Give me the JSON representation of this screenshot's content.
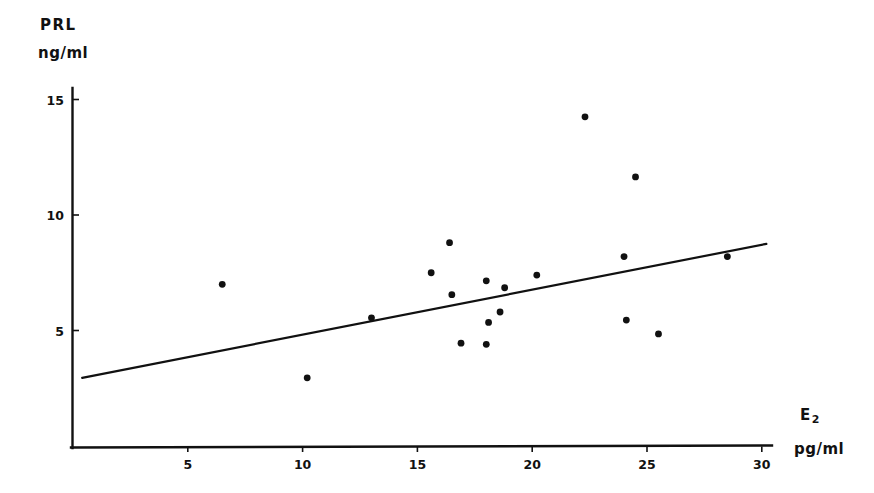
{
  "figure": {
    "background_color": "#ffffff",
    "ink_color": "#111111"
  },
  "axes": {
    "y": {
      "title": "PRL",
      "unit": "ng/ml",
      "ticks": [
        5,
        10,
        15
      ],
      "tick_labels": [
        "5",
        "10",
        "15"
      ],
      "range": [
        0,
        16.4
      ]
    },
    "x": {
      "title": "E",
      "title_sub": "2",
      "unit": "pg/ml",
      "ticks": [
        5,
        10,
        15,
        20,
        25,
        30
      ],
      "tick_labels": [
        "5",
        "10",
        "15",
        "20",
        "25",
        "30"
      ],
      "range": [
        0,
        31.3
      ]
    }
  },
  "chart_data": {
    "type": "scatter",
    "title": "",
    "xlabel": "E2 (pg/ml)",
    "ylabel": "PRL (ng/ml)",
    "xlim": [
      0,
      31.3
    ],
    "ylim": [
      0,
      16.4
    ],
    "grid": false,
    "legend": "none",
    "marker": {
      "shape": "circle",
      "color": "#111111",
      "radius_px": 3.4
    },
    "points": [
      {
        "x": 6.5,
        "y": 7.0
      },
      {
        "x": 10.2,
        "y": 2.95
      },
      {
        "x": 13.0,
        "y": 5.55
      },
      {
        "x": 15.6,
        "y": 7.5
      },
      {
        "x": 16.4,
        "y": 8.8
      },
      {
        "x": 16.5,
        "y": 6.55
      },
      {
        "x": 16.9,
        "y": 4.45
      },
      {
        "x": 18.0,
        "y": 7.15
      },
      {
        "x": 18.0,
        "y": 4.4
      },
      {
        "x": 18.1,
        "y": 5.35
      },
      {
        "x": 18.6,
        "y": 5.8
      },
      {
        "x": 18.8,
        "y": 6.85
      },
      {
        "x": 20.2,
        "y": 7.4
      },
      {
        "x": 22.3,
        "y": 14.25
      },
      {
        "x": 24.0,
        "y": 8.2
      },
      {
        "x": 24.1,
        "y": 5.45
      },
      {
        "x": 24.5,
        "y": 11.65
      },
      {
        "x": 25.5,
        "y": 4.85
      },
      {
        "x": 28.5,
        "y": 8.2
      }
    ],
    "regression_line": {
      "x_start": 0.4,
      "y_start": 2.95,
      "x_end": 30.2,
      "y_end": 8.75,
      "color": "#111111",
      "width_px": 2.2
    }
  }
}
